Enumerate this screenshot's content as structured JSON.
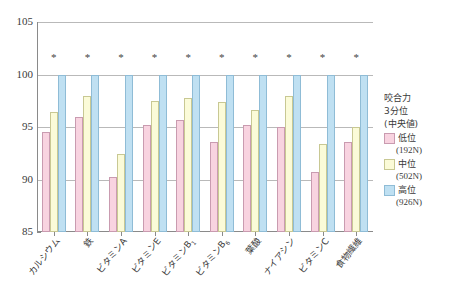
{
  "chart_data": {
    "type": "bar",
    "title": "",
    "xlabel": "",
    "ylabel": "",
    "ylim": [
      85,
      105
    ],
    "yticks": [
      85,
      90,
      95,
      100,
      105
    ],
    "grid": true,
    "legend_position": "right",
    "categories": [
      "カルシウム",
      "鉄",
      "ビタミンA",
      "ビタミンE",
      "ビタミンB1",
      "ビタミンB6",
      "葉酸",
      "ナイアシン",
      "ビタミンC",
      "食物繊維"
    ],
    "series": [
      {
        "name": "低位",
        "note": "(192N)",
        "color": "#f8d3e0",
        "values": [
          94.5,
          96.0,
          90.2,
          95.2,
          95.7,
          93.6,
          95.2,
          95.0,
          90.7,
          93.6
        ]
      },
      {
        "name": "中位",
        "note": "(502N)",
        "color": "#fbfbd8",
        "values": [
          96.4,
          98.0,
          92.4,
          97.5,
          97.8,
          97.4,
          96.6,
          98.0,
          93.4,
          95.0
        ]
      },
      {
        "name": "高位",
        "note": "(926N)",
        "color": "#bfe0f2",
        "values": [
          100,
          100,
          100,
          100,
          100,
          100,
          100,
          100,
          100,
          100
        ]
      }
    ],
    "annotations": [
      "*",
      "*",
      "*",
      "*",
      "*",
      "*",
      "*",
      "*",
      "*",
      "*"
    ],
    "annotation_symbol": "*"
  },
  "legend": {
    "title_line1": "咬合力",
    "title_line2": "3分位",
    "title_line3": "(中央値)",
    "items": [
      {
        "label": "低位",
        "sublabel": "(192N)"
      },
      {
        "label": "中位",
        "sublabel": "(502N)"
      },
      {
        "label": "高位",
        "sublabel": "(926N)"
      }
    ]
  },
  "axis": {
    "y_tick_labels": [
      "105",
      "100",
      "95",
      "90",
      "85"
    ]
  }
}
